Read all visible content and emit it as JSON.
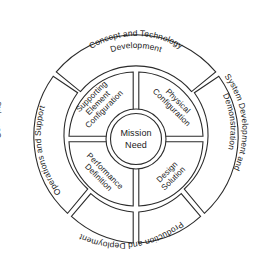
{
  "diagram": {
    "center": {
      "line1": "Mission",
      "line2": "Need"
    },
    "inner_ring": {
      "quadrants": [
        {
          "id": "supporting-element-configuration",
          "lines": [
            "Supporting",
            "Element",
            "Configuration"
          ],
          "position": "upper-left"
        },
        {
          "id": "physical-configuration",
          "lines": [
            "Physical",
            "Configuration"
          ],
          "position": "upper-right"
        },
        {
          "id": "design-solution",
          "lines": [
            "Design",
            "Solution"
          ],
          "position": "lower-right"
        },
        {
          "id": "performance-definition",
          "lines": [
            "Performance",
            "Definition"
          ],
          "position": "lower-left"
        }
      ]
    },
    "outer_ring": {
      "segments": [
        {
          "id": "concept-and-technology-development",
          "lines": [
            "Concept and Technology",
            "Development"
          ],
          "position": "top"
        },
        {
          "id": "system-development-and-demonstration",
          "lines": [
            "System Development and",
            "Demonstration"
          ],
          "position": "right"
        },
        {
          "id": "production-and-deployment",
          "lines": [
            "Production and Deployment"
          ],
          "position": "bottom-right"
        },
        {
          "id": "operations-and-support",
          "lines": [
            "Operations and Support"
          ],
          "position": "bottom-left"
        },
        {
          "id": "concepts",
          "lines": [
            "Concepts"
          ],
          "position": "left"
        }
      ]
    },
    "colors": {
      "stroke": "#2b2b2b",
      "fill": "#ffffff",
      "text": "#1a1a1a",
      "background": "#ffffff"
    }
  }
}
